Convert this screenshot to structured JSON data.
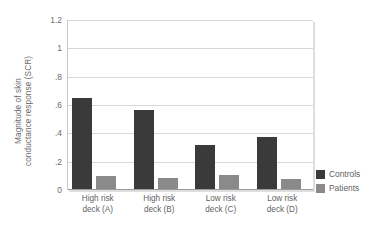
{
  "chart_data": {
    "type": "bar",
    "title": "",
    "xlabel": "",
    "ylabel": "Magnitude of skin conductance response (SCR)",
    "ylabel_lines": [
      "Magnitude of skin",
      "conductance response (SCR)"
    ],
    "categories": [
      "High risk deck (A)",
      "High risk deck (B)",
      "Low risk deck (C)",
      "Low risk deck (D)"
    ],
    "category_lines": [
      [
        "High risk",
        "deck (A)"
      ],
      [
        "High risk",
        "deck (B)"
      ],
      [
        "Low risk",
        "deck (C)"
      ],
      [
        "Low risk",
        "deck (D)"
      ]
    ],
    "series": [
      {
        "name": "Controls",
        "color": "#3a3a3a",
        "values": [
          0.64,
          0.56,
          0.31,
          0.37
        ]
      },
      {
        "name": "Patients",
        "color": "#8a8a8a",
        "values": [
          0.09,
          0.075,
          0.1,
          0.07
        ]
      }
    ],
    "ylim": [
      0,
      1.2
    ],
    "yticks": [
      0,
      0.2,
      0.4,
      0.6,
      0.8,
      1.0,
      1.2
    ],
    "ytick_labels": [
      "0",
      ".2",
      ".4",
      ".6",
      ".8",
      "1",
      "1.2"
    ],
    "grid": true,
    "legend_position": "right"
  },
  "legend": {
    "entries": [
      {
        "label": "Controls",
        "color": "#3a3a3a"
      },
      {
        "label": "Patients",
        "color": "#8a8a8a"
      }
    ]
  }
}
